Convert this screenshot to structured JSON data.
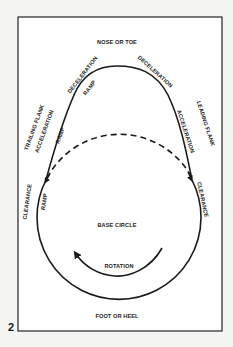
{
  "figure": {
    "number": "2",
    "colors": {
      "line": "#1a1a1a",
      "background": "#f4f4f2",
      "frame_fill": "#ffffff"
    }
  },
  "labels": {
    "nose": "NOSE OR TOE",
    "decel_left": "DECELERATION",
    "decel_left_ramp": "RAMP",
    "decel_right": "DECELERATION",
    "trailing_flank": "TRAILING FLANK",
    "accel_left": "ACCELERATION",
    "accel_left_ramp": "RAMP",
    "leading_flank": "LEADING FLANK",
    "accel_right": "ACCELERATION",
    "clearance_left": "CLEARANCE",
    "clearance_left_ramp": "RAMP",
    "clearance_right": "CLEARANCE",
    "base_circle": "BASE CIRCLE",
    "rotation": "ROTATION",
    "foot": "FOOT OR HEEL"
  }
}
